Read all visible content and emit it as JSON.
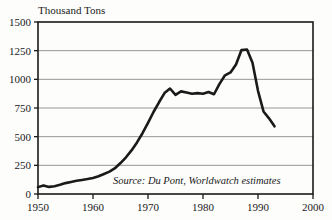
{
  "chart_data": {
    "type": "line",
    "title": "",
    "ylabel": "Thousand Tons",
    "xlabel": "",
    "ylim": [
      0,
      1500
    ],
    "xlim": [
      1950,
      2000
    ],
    "grid": true,
    "legend": "none",
    "y_ticks": [
      0,
      250,
      500,
      750,
      1000,
      1250,
      1500
    ],
    "y_tick_labels": [
      "0",
      "250",
      "500",
      "750",
      "1000",
      "1250",
      "1500"
    ],
    "x_ticks": [
      1950,
      1960,
      1970,
      1980,
      1990,
      2000
    ],
    "x_tick_labels": [
      "1950",
      "1960",
      "1970",
      "1980",
      "1990",
      "2000"
    ],
    "annotation": "Source: Du Pont, Worldwatch estimates",
    "line_color": "#1a1a1a",
    "grid_color": "#8a8a8a",
    "series": [
      {
        "name": "CFC production",
        "x": [
          1950,
          1951,
          1952,
          1953,
          1954,
          1955,
          1956,
          1957,
          1958,
          1959,
          1960,
          1961,
          1962,
          1963,
          1964,
          1965,
          1966,
          1967,
          1968,
          1969,
          1970,
          1971,
          1972,
          1973,
          1974,
          1975,
          1976,
          1977,
          1978,
          1979,
          1980,
          1981,
          1982,
          1983,
          1984,
          1985,
          1986,
          1987,
          1988,
          1989,
          1990,
          1991,
          1992,
          1993
        ],
        "values": [
          60,
          75,
          62,
          68,
          80,
          95,
          105,
          115,
          122,
          130,
          140,
          155,
          175,
          195,
          225,
          270,
          320,
          380,
          450,
          530,
          620,
          715,
          800,
          880,
          920,
          865,
          895,
          885,
          875,
          880,
          875,
          890,
          870,
          960,
          1035,
          1060,
          1130,
          1255,
          1260,
          1145,
          900,
          720,
          660,
          590
        ]
      }
    ]
  },
  "page": {
    "background_color": "#fdfdfc"
  }
}
